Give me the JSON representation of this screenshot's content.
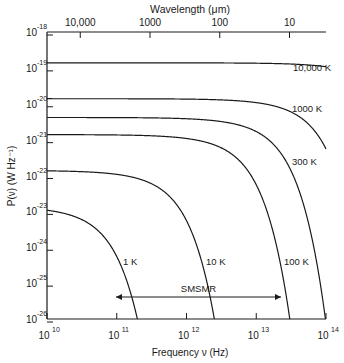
{
  "chart_data": {
    "type": "line",
    "title": "",
    "xlabel": "Frequency ν (Hz)",
    "ylabel": "P(ν) (W Hz⁻¹)",
    "top_axis_label": "Wavelength (μm)",
    "x_scale": "log",
    "y_scale": "log",
    "xlim": [
      10000000000.0,
      100000000000000.0
    ],
    "ylim": [
      1e-26,
      1e-18
    ],
    "grid": false,
    "legend": "inline curve labels",
    "x_ticks": [
      {
        "value": 10000000000.0,
        "label_base": "10",
        "label_exp": "10"
      },
      {
        "value": 100000000000.0,
        "label_base": "10",
        "label_exp": "11"
      },
      {
        "value": 1000000000000.0,
        "label_base": "10",
        "label_exp": "12"
      },
      {
        "value": 10000000000000.0,
        "label_base": "10",
        "label_exp": "13"
      },
      {
        "value": 100000000000000.0,
        "label_base": "10",
        "label_exp": "14"
      }
    ],
    "y_ticks": [
      {
        "value": 1e-18,
        "label_base": "10",
        "label_exp": "-18"
      },
      {
        "value": 1e-19,
        "label_base": "10",
        "label_exp": "-19"
      },
      {
        "value": 1e-20,
        "label_base": "10",
        "label_exp": "-20"
      },
      {
        "value": 1e-21,
        "label_base": "10",
        "label_exp": "-21"
      },
      {
        "value": 1e-22,
        "label_base": "10",
        "label_exp": "-22"
      },
      {
        "value": 1e-23,
        "label_base": "10",
        "label_exp": "-23"
      },
      {
        "value": 1e-24,
        "label_base": "10",
        "label_exp": "-24"
      },
      {
        "value": 1e-25,
        "label_base": "10",
        "label_exp": "-25"
      },
      {
        "value": 1e-26,
        "label_base": "10",
        "label_exp": "-26"
      }
    ],
    "top_ticks": [
      {
        "wavelength_um": 10000,
        "label": "10,000"
      },
      {
        "wavelength_um": 1000,
        "label": "1000"
      },
      {
        "wavelength_um": 100,
        "label": "100"
      },
      {
        "wavelength_um": 10,
        "label": "10"
      }
    ],
    "series": [
      {
        "name": "10,000 K",
        "temperature_K": 10000,
        "label": "10,000 K",
        "low_freq_level": 1.38e-19
      },
      {
        "name": "1000 K",
        "temperature_K": 1000,
        "label": "1000 K",
        "low_freq_level": 1.38e-20
      },
      {
        "name": "300 K",
        "temperature_K": 300,
        "label": "300 K",
        "low_freq_level": 4.14e-21
      },
      {
        "name": "100 K",
        "temperature_K": 100,
        "label": "100 K",
        "low_freq_level": 1.38e-21
      },
      {
        "name": "10 K",
        "temperature_K": 10,
        "label": "10 K",
        "low_freq_level": 1.38e-22
      },
      {
        "name": "1 K",
        "temperature_K": 1,
        "label": "1 K",
        "low_freq_level": 1.38e-23
      }
    ],
    "formula": "P(ν) = hν / (exp(hν/kT) − 1)",
    "annotations": [
      {
        "text": "SMSMR",
        "type": "double-arrow",
        "x_from": 100000000000.0,
        "x_to": 35000000000000.0,
        "y": 3e-26
      }
    ]
  }
}
